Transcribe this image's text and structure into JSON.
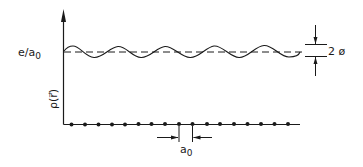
{
  "diagram": {
    "y_axis": {
      "label": "ρ(r⃗)",
      "level_label_main": "e/a",
      "level_label_sub": "0"
    },
    "amplitude_marker": {
      "label": "2 ø"
    },
    "lattice": {
      "spacing_label_main": "a",
      "spacing_label_sub": "0",
      "atom_count": 18
    },
    "colors": {
      "ink": "#1a1a1a",
      "background": "#ffffff"
    }
  }
}
